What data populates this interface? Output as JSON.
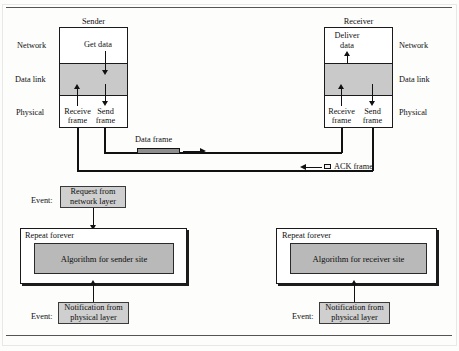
{
  "figure": {
    "top_rule": true,
    "bottom_rule": true
  },
  "sender": {
    "title": "Sender",
    "layers": [
      {
        "name": "Network",
        "side": "left"
      },
      {
        "name": "Data link",
        "side": "left"
      },
      {
        "name": "Physical",
        "side": "left"
      }
    ],
    "actions": {
      "get_data": "Get data",
      "receive_frame_line1": "Receive",
      "receive_frame_line2": "frame",
      "send_frame_line1": "Send",
      "send_frame_line2": "frame"
    }
  },
  "receiver": {
    "title": "Receiver",
    "layers": [
      {
        "name": "Network",
        "side": "right"
      },
      {
        "name": "Data link",
        "side": "right"
      },
      {
        "name": "Physical",
        "side": "right"
      }
    ],
    "actions": {
      "deliver_data_line1": "Deliver",
      "deliver_data_line2": "data",
      "receive_frame_line1": "Receive",
      "receive_frame_line2": "frame",
      "send_frame_line1": "Send",
      "send_frame_line2": "frame"
    }
  },
  "channel": {
    "data_frame_label": "Data frame",
    "ack_frame_label": "ACK frame"
  },
  "sender_algorithm": {
    "event_label": "Event:",
    "top_event_line1": "Request from",
    "top_event_line2": "network layer",
    "repeat_label": "Repeat forever",
    "algorithm_label": "Algorithm for sender site",
    "bottom_event_line1": "Notification from",
    "bottom_event_line2": "physical layer"
  },
  "receiver_algorithm": {
    "event_label": "Event:",
    "repeat_label": "Repeat forever",
    "algorithm_label": "Algorithm for receiver site",
    "bottom_event_line1": "Notification from",
    "bottom_event_line2": "physical layer"
  },
  "colors": {
    "band_fill": "#c9c9c9",
    "algo_fill": "#b9b9b9",
    "event_fill": "#cfcfcf",
    "data_frame_fill": "#8e8e8e",
    "ack_frame_fill": "#efefef",
    "stroke": "#111111"
  }
}
